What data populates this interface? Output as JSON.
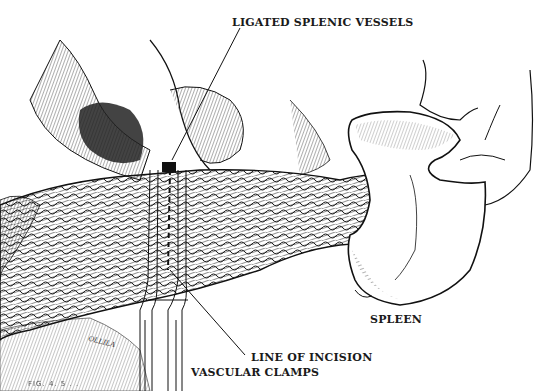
{
  "figure": {
    "labels": {
      "ligated_splenic_vessels": "LIGATED SPLENIC VESSELS",
      "spleen": "SPLEEN",
      "line_of_incision": "LINE OF INCISION",
      "vascular_clamps": "VASCULAR CLAMPS"
    },
    "artist_signature": "OLLILA",
    "caption_fragment": "FIG. 4. 5 . ."
  },
  "colors": {
    "ink": "#1a1a1a",
    "paper": "#ffffff"
  }
}
